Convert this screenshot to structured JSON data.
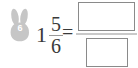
{
  "problem": {
    "badge": {
      "icon": "bunny-avatar-icon",
      "number": "6"
    },
    "expression": {
      "whole_number": "1",
      "fraction_numerator": "5",
      "fraction_denominator": "6",
      "equals_sign": "="
    },
    "answer": {
      "numerator_value": "",
      "numerator_placeholder": "",
      "denominator_value": "",
      "denominator_placeholder": ""
    }
  },
  "colors": {
    "text": "#3a3a3a",
    "box_border": "#8a8a8a",
    "fraction_bar": "#c9c9c9",
    "avatar_fill": "#c6c6c6",
    "background": "#ffffff"
  }
}
